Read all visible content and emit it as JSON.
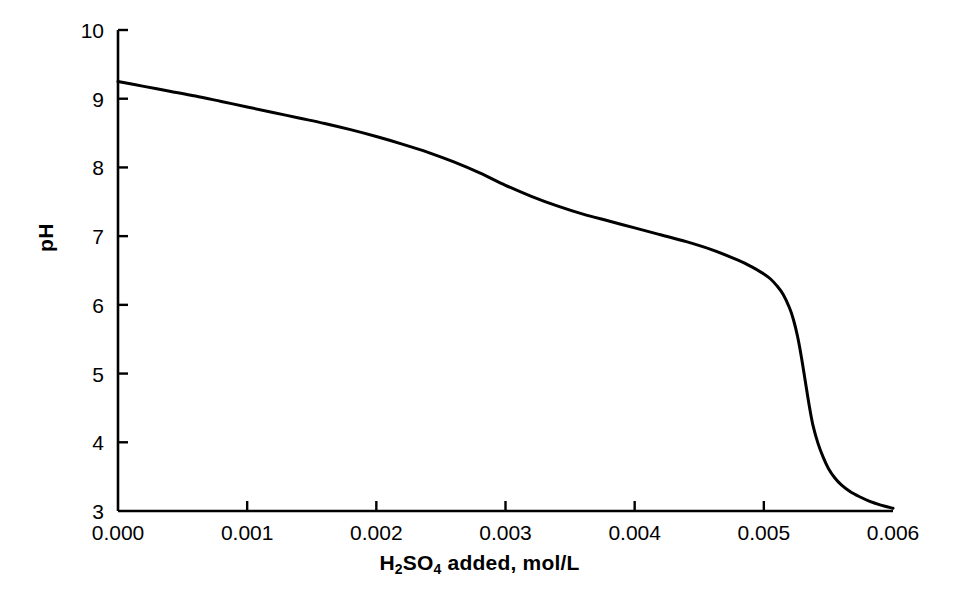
{
  "chart_data": {
    "type": "line",
    "title": "",
    "xlabel": "H2SO4 added, mol/L",
    "xlabel_parts": {
      "pre": "H",
      "sub1": "2",
      "mid": "SO",
      "sub2": "4",
      "post": " added, mol/L"
    },
    "ylabel": "pH",
    "xlim": [
      0.0,
      0.006
    ],
    "ylim": [
      3,
      10
    ],
    "xticks": [
      0.0,
      0.001,
      0.002,
      0.003,
      0.004,
      0.005,
      0.006
    ],
    "xticklabels": [
      "0.000",
      "0.001",
      "0.002",
      "0.003",
      "0.004",
      "0.005",
      "0.006"
    ],
    "yticks": [
      3,
      4,
      5,
      6,
      7,
      8,
      9,
      10
    ],
    "yticklabels": [
      "3",
      "4",
      "5",
      "6",
      "7",
      "8",
      "9",
      "10"
    ],
    "grid": false,
    "legend": null,
    "tick_direction": "in",
    "spines": [
      "left",
      "bottom"
    ],
    "line_color": "#000000",
    "line_width": 3,
    "background": "#ffffff",
    "x": [
      0.0,
      0.0002,
      0.0004,
      0.0006,
      0.0008,
      0.001,
      0.0012,
      0.0014,
      0.0016,
      0.0018,
      0.002,
      0.0022,
      0.0024,
      0.0026,
      0.0028,
      0.003,
      0.0032,
      0.0034,
      0.0036,
      0.0038,
      0.004,
      0.0042,
      0.0044,
      0.0046,
      0.0048,
      0.0049,
      0.005,
      0.00505,
      0.0051,
      0.00515,
      0.0052,
      0.00523,
      0.00526,
      0.00529,
      0.00532,
      0.00535,
      0.00538,
      0.00542,
      0.00546,
      0.0055,
      0.00555,
      0.0056,
      0.00567,
      0.00575,
      0.00582,
      0.0059,
      0.006
    ],
    "y": [
      9.25,
      9.18,
      9.11,
      9.04,
      8.96,
      8.88,
      8.8,
      8.72,
      8.64,
      8.55,
      8.45,
      8.34,
      8.22,
      8.08,
      7.92,
      7.74,
      7.58,
      7.44,
      7.32,
      7.22,
      7.12,
      7.02,
      6.92,
      6.8,
      6.65,
      6.56,
      6.45,
      6.38,
      6.28,
      6.15,
      5.95,
      5.78,
      5.55,
      5.25,
      4.9,
      4.55,
      4.25,
      3.98,
      3.78,
      3.62,
      3.48,
      3.38,
      3.28,
      3.2,
      3.14,
      3.09,
      3.04
    ],
    "annotations": []
  },
  "plot_geometry": {
    "left_px": 118,
    "right_px": 893,
    "top_px": 30,
    "bottom_px": 511,
    "tick_length_px": 10
  }
}
